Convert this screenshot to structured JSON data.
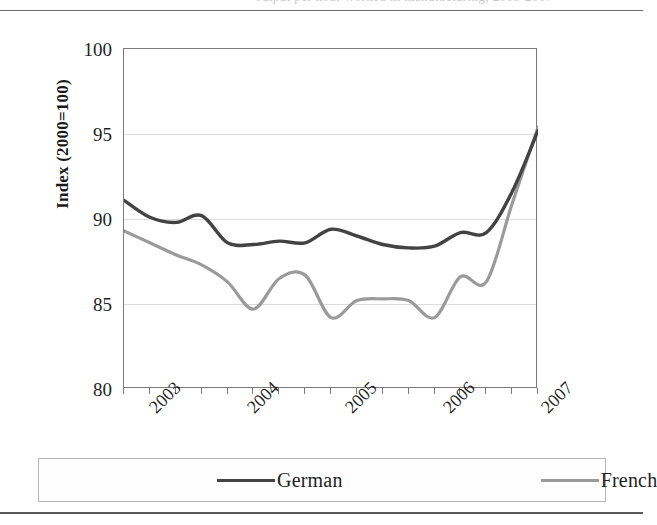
{
  "figure": {
    "caption_ghost": "output per hour worked in manufacturing, 2003-2007",
    "y_axis": {
      "label": "Index (2000=100)",
      "ticks": [
        "100",
        "95",
        "90",
        "85",
        "80"
      ],
      "min": 80,
      "max": 100
    },
    "x_axis": {
      "ticks": [
        "2003",
        "2004",
        "2005",
        "2006",
        "2007"
      ]
    },
    "legend": {
      "items": [
        {
          "label": "German",
          "color": "#434343"
        },
        {
          "label": "French",
          "color": "#9a9a9a"
        }
      ]
    }
  },
  "chart_data": {
    "type": "line",
    "title": "",
    "xlabel": "",
    "ylabel": "Index (2000=100)",
    "ylim": [
      80,
      100
    ],
    "xlim": [
      "2002Q4",
      "2006Q4"
    ],
    "grid": true,
    "gridlines": [
      85,
      90,
      95
    ],
    "legend_position": "bottom",
    "x": [
      "2002Q4",
      "2003Q1",
      "2003Q2",
      "2003Q3",
      "2003Q4",
      "2004Q1",
      "2004Q2",
      "2004Q3",
      "2004Q4",
      "2005Q1",
      "2005Q2",
      "2005Q3",
      "2005Q4",
      "2006Q1",
      "2006Q2",
      "2006Q3",
      "2006Q4"
    ],
    "series": [
      {
        "name": "German",
        "color": "#434343",
        "values": [
          91.1,
          90.1,
          89.8,
          90.2,
          88.6,
          88.5,
          88.7,
          88.6,
          89.4,
          89.0,
          88.5,
          88.3,
          88.4,
          89.2,
          89.2,
          91.6,
          95.2
        ]
      },
      {
        "name": "French",
        "color": "#9a9a9a",
        "values": [
          89.3,
          88.6,
          87.9,
          87.3,
          86.3,
          84.7,
          86.5,
          86.7,
          84.2,
          85.2,
          85.3,
          85.2,
          84.2,
          86.6,
          86.3,
          90.9,
          95.4
        ]
      }
    ],
    "annotations": [
      "German series begins near 91 and trends mildly downward through 2005 before rising sharply in 2006.",
      "French series begins near 89, falls to troughs near 84 in 2004 and late 2005, then rises sharply in 2006 and peaks near 95.4, crossing the German line at the right edge."
    ]
  }
}
